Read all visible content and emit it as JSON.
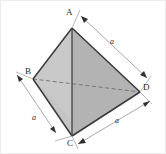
{
  "figure": {
    "name": "regular-tetrahedron-diagram",
    "caption_text": "",
    "background_color": "#ffffff",
    "edge_color": "#3a3a3a",
    "hidden_edge_color": "#6b6b6b",
    "dimension_line_color": "#8c8c8c",
    "face_left_color": "#c9c9c9",
    "face_right_color": "#b3b3b3",
    "frame_color": "#e8e8e8"
  },
  "vertices": [
    {
      "id": "A",
      "label": "A",
      "x": 72,
      "y": 28,
      "label_x": 66,
      "label_y": 14
    },
    {
      "id": "B",
      "label": "B",
      "x": 33,
      "y": 79,
      "label_x": 26,
      "label_y": 68
    },
    {
      "id": "C",
      "label": "C",
      "x": 72,
      "y": 136,
      "label_x": 67,
      "label_y": 139
    },
    {
      "id": "D",
      "label": "D",
      "x": 140,
      "y": 92,
      "label_x": 143,
      "label_y": 84
    }
  ],
  "edges": [
    {
      "from": "A",
      "to": "B",
      "style": "solid",
      "visible": true
    },
    {
      "from": "A",
      "to": "D",
      "style": "solid",
      "visible": true
    },
    {
      "from": "A",
      "to": "C",
      "style": "solid",
      "visible": true
    },
    {
      "from": "B",
      "to": "C",
      "style": "solid",
      "visible": true
    },
    {
      "from": "C",
      "to": "D",
      "style": "solid",
      "visible": true
    },
    {
      "from": "B",
      "to": "D",
      "style": "dashed",
      "visible": false
    }
  ],
  "faces": [
    {
      "id": "ABC",
      "vertices": "A,B,C",
      "shade": "#c9c9c9"
    },
    {
      "id": "ACD",
      "vertices": "A,C,D",
      "shade": "#b3b3b3"
    }
  ],
  "dimensions": [
    {
      "id": "dim-AD",
      "label": "a",
      "edge": "A-D",
      "label_x": 110,
      "label_y": 41,
      "arrows": "both"
    },
    {
      "id": "dim-BC",
      "label": "a",
      "edge": "B-C",
      "label_x": 33,
      "label_y": 117,
      "arrows": "both"
    },
    {
      "id": "dim-CD",
      "label": "a",
      "edge": "C-D",
      "label_x": 115,
      "label_y": 120,
      "arrows": "both"
    }
  ]
}
